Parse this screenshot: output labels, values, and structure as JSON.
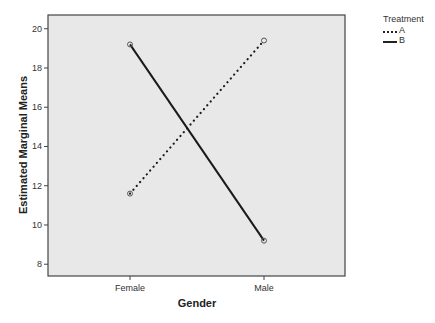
{
  "chart_data": {
    "type": "line",
    "title": "",
    "xlabel": "Gender",
    "ylabel": "Estimated Marginal Means",
    "categories": [
      "Female",
      "Male"
    ],
    "series": [
      {
        "name": "A",
        "style": "dotted",
        "values": [
          11.6,
          19.4
        ]
      },
      {
        "name": "B",
        "style": "solid",
        "values": [
          19.2,
          9.2
        ]
      }
    ],
    "ylim": [
      7.4,
      20.7
    ],
    "yticks": [
      8,
      10,
      12,
      14,
      16,
      18,
      20
    ],
    "grid": false,
    "legend": {
      "title": "Treatment",
      "position": "right"
    },
    "plot_background": "#e8e8e8",
    "line_color": "#1a1a1a"
  },
  "legend": {
    "title": "Treatment",
    "items": [
      {
        "label": "A"
      },
      {
        "label": "B"
      }
    ]
  },
  "axes": {
    "xlabel": "Gender",
    "ylabel": "Estimated Marginal Means"
  }
}
